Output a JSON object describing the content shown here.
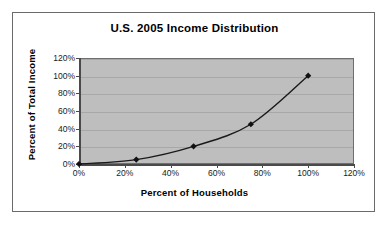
{
  "chart_data": {
    "type": "line",
    "title": "U.S. 2005 Income Distribution",
    "xlabel": "Percent of Households",
    "ylabel": "Percent of Total Income",
    "x": [
      0,
      25,
      50,
      75,
      100
    ],
    "values": [
      0,
      5,
      20,
      45,
      100
    ],
    "series": [
      {
        "name": "Income Distribution",
        "x": [
          0,
          25,
          50,
          75,
          100
        ],
        "values": [
          0,
          5,
          20,
          45,
          100
        ]
      }
    ],
    "xlim": [
      0,
      120
    ],
    "ylim": [
      0,
      120
    ],
    "xticks": [
      "0%",
      "20%",
      "40%",
      "60%",
      "80%",
      "100%",
      "120%"
    ],
    "yticks": [
      "0%",
      "20%",
      "40%",
      "60%",
      "80%",
      "100%",
      "120%"
    ],
    "xtick_values": [
      0,
      20,
      40,
      60,
      80,
      100,
      120
    ],
    "ytick_values": [
      0,
      20,
      40,
      60,
      80,
      100,
      120
    ],
    "grid": "horizontal",
    "legend": "none",
    "marker": "diamond",
    "colors": {
      "plot_background": "#bebebe",
      "figure_background": "#ffffff",
      "line": "#1a1a1a",
      "marker": "#111111",
      "gridline": "#a8a8a8",
      "axis": "#4a4a4a",
      "frame_border": "#6b6b6b",
      "text": "#000000"
    }
  }
}
